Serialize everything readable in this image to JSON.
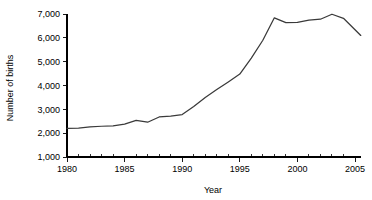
{
  "chart_data": {
    "type": "line",
    "title": "",
    "xlabel": "Year",
    "ylabel": "Number of births",
    "xlim": [
      1980,
      2005.5
    ],
    "ylim": [
      1000,
      7000
    ],
    "grid": false,
    "legend": false,
    "x_tick_labels": [
      "1980",
      "1985",
      "1990",
      "1995",
      "2000",
      "2005"
    ],
    "x_tick_values": [
      1980,
      1985,
      1990,
      1995,
      2000,
      2005
    ],
    "x_minor_tick_interval": 1,
    "y_tick_labels": [
      "1,000",
      "2,000",
      "3,000",
      "4,000",
      "5,000",
      "6,000",
      "7,000"
    ],
    "y_tick_values": [
      1000,
      2000,
      3000,
      4000,
      5000,
      6000,
      7000
    ],
    "series": [
      {
        "name": "Number of births",
        "color": "#3a3a3a",
        "x": [
          1980,
          1981,
          1982,
          1983,
          1984,
          1985,
          1986,
          1987,
          1988,
          1989,
          1990,
          1991,
          1992,
          1993,
          1994,
          1995,
          1996,
          1997,
          1998,
          1999,
          2000,
          2001,
          2002,
          2003,
          2004,
          2005.5
        ],
        "values": [
          2200,
          2210,
          2260,
          2290,
          2310,
          2380,
          2540,
          2460,
          2680,
          2720,
          2780,
          3120,
          3500,
          3830,
          4150,
          4480,
          5150,
          5900,
          6840,
          6640,
          6650,
          6740,
          6780,
          6990,
          6820,
          6100
        ]
      }
    ]
  }
}
